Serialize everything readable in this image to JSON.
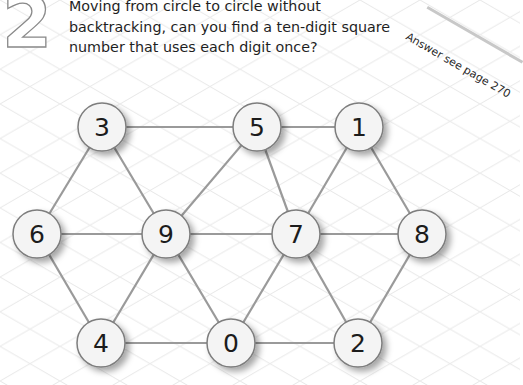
{
  "puzzle": {
    "number": "2",
    "prompt_lines": [
      "Moving from circle to circle without",
      "backtracking, can you find a ten-digit square",
      "number that uses each digit once?"
    ],
    "answer_note": "Answer see page 270"
  },
  "graph": {
    "node_radius": 24,
    "nodes": [
      {
        "id": "n3",
        "label": "3",
        "x": 102,
        "y": 127
      },
      {
        "id": "n5",
        "label": "5",
        "x": 257,
        "y": 127
      },
      {
        "id": "n1",
        "label": "1",
        "x": 359,
        "y": 127
      },
      {
        "id": "n6",
        "label": "6",
        "x": 37,
        "y": 234
      },
      {
        "id": "n9",
        "label": "9",
        "x": 166,
        "y": 234
      },
      {
        "id": "n7",
        "label": "7",
        "x": 296,
        "y": 234
      },
      {
        "id": "n8",
        "label": "8",
        "x": 422,
        "y": 234
      },
      {
        "id": "n4",
        "label": "4",
        "x": 101,
        "y": 343
      },
      {
        "id": "n0",
        "label": "0",
        "x": 231,
        "y": 343
      },
      {
        "id": "n2",
        "label": "2",
        "x": 358,
        "y": 343
      }
    ],
    "edges": [
      [
        "n3",
        "n5"
      ],
      [
        "n5",
        "n1"
      ],
      [
        "n3",
        "n6"
      ],
      [
        "n3",
        "n9"
      ],
      [
        "n5",
        "n9"
      ],
      [
        "n5",
        "n7"
      ],
      [
        "n1",
        "n7"
      ],
      [
        "n1",
        "n8"
      ],
      [
        "n6",
        "n9"
      ],
      [
        "n9",
        "n7"
      ],
      [
        "n7",
        "n8"
      ],
      [
        "n6",
        "n4"
      ],
      [
        "n9",
        "n4"
      ],
      [
        "n9",
        "n0"
      ],
      [
        "n7",
        "n0"
      ],
      [
        "n7",
        "n2"
      ],
      [
        "n8",
        "n2"
      ],
      [
        "n4",
        "n0"
      ],
      [
        "n0",
        "n2"
      ]
    ]
  },
  "colors": {
    "edge": "#9a9a9a",
    "node_fill": "#f4f4f4",
    "node_stroke": "#7d7d7d",
    "grid": "#e6e6e6",
    "text": "#1f1f1f"
  }
}
